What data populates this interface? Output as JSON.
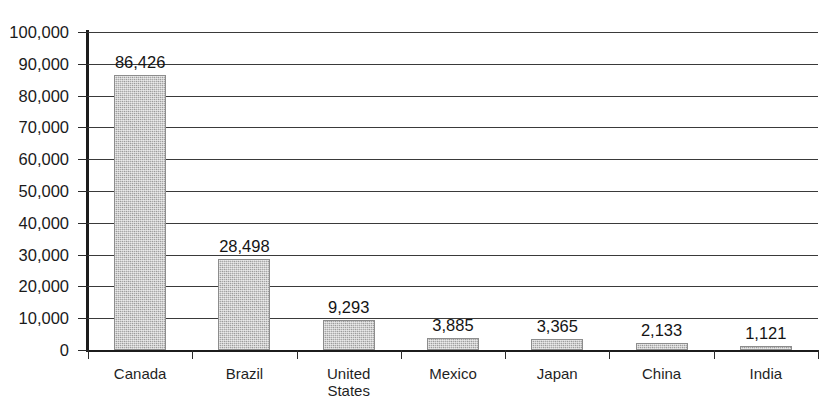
{
  "chart_data": {
    "type": "bar",
    "title": "",
    "subtitle": "",
    "xlabel": "",
    "ylabel": "",
    "categories": [
      "Canada",
      "Brazil",
      "United\nStates",
      "Mexico",
      "Japan",
      "China",
      "India"
    ],
    "values": [
      86426,
      28498,
      9293,
      3885,
      3365,
      2133,
      1121
    ],
    "value_labels": [
      "86,426",
      "28,498",
      "9,293",
      "3,885",
      "3,365",
      "2,133",
      "1,121"
    ],
    "ylim": [
      0,
      100000
    ],
    "ytick_values": [
      0,
      10000,
      20000,
      30000,
      40000,
      50000,
      60000,
      70000,
      80000,
      90000,
      100000
    ],
    "ytick_labels": [
      "0",
      "10,000",
      "20,000",
      "30,000",
      "40,000",
      "50,000",
      "60,000",
      "70,000",
      "80,000",
      "90,000",
      "100,000"
    ],
    "grid": true,
    "legend": false,
    "legend_position": "none",
    "bar_color": "#a9a9a9",
    "axis_color": "#1c1c1c",
    "grid_color": "#3a3a3a",
    "text_color": "#1a1a1a"
  },
  "title_remnant": ""
}
